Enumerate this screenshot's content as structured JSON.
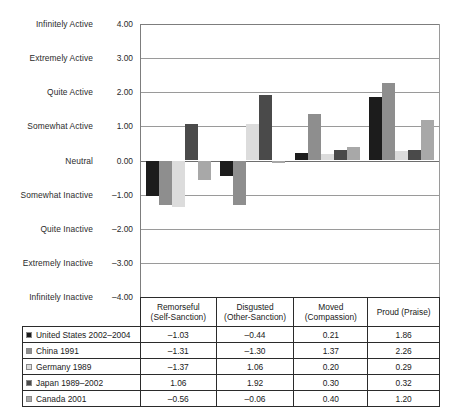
{
  "chart_data": {
    "type": "bar",
    "title": "",
    "xlabel": "",
    "ylabel": "",
    "ylim": [
      -4,
      4
    ],
    "grid": true,
    "legend_position": "table-left",
    "categories": [
      "Remorseful (Self-Sanction)",
      "Disgusted (Other-Sanction)",
      "Moved (Compassion)",
      "Proud (Praise)"
    ],
    "series": [
      {
        "name": "United States 2002–2004",
        "color": "#1c1c1c",
        "values": [
          -1.03,
          -0.44,
          0.21,
          1.86
        ]
      },
      {
        "name": "China 1991",
        "color": "#8e8e8e",
        "values": [
          -1.31,
          -1.3,
          1.37,
          2.26
        ]
      },
      {
        "name": "Germany 1989",
        "color": "#dcdcdc",
        "values": [
          -1.37,
          1.06,
          0.2,
          0.29
        ]
      },
      {
        "name": "Japan 1989–2002",
        "color": "#4a4a4a",
        "values": [
          1.06,
          1.92,
          0.3,
          0.32
        ]
      },
      {
        "name": "Canada 2001",
        "color": "#a8a8a8",
        "values": [
          -0.56,
          -0.06,
          0.4,
          1.2
        ]
      }
    ],
    "y_ticks": [
      {
        "value": "4.00",
        "label": "Infinitely Active"
      },
      {
        "value": "3.00",
        "label": "Extremely Active"
      },
      {
        "value": "2.00",
        "label": "Quite Active"
      },
      {
        "value": "1.00",
        "label": "Somewhat Active"
      },
      {
        "value": "0.00",
        "label": "Neutral"
      },
      {
        "value": "–1.00",
        "label": "Somewhat Inactive"
      },
      {
        "value": "–2.00",
        "label": "Quite Inactive"
      },
      {
        "value": "–3.00",
        "label": "Extremely Inactive"
      },
      {
        "value": "–4.00",
        "label": "Infinitely Inactive"
      }
    ]
  },
  "table": {
    "headers": [
      {
        "line1": "Remorseful",
        "line2": "(Self-Sanction)"
      },
      {
        "line1": "Disgusted",
        "line2": "(Other-Sanction)"
      },
      {
        "line1": "Moved",
        "line2": "(Compassion)"
      },
      {
        "line1": "Proud (Praise)",
        "line2": ""
      }
    ],
    "rows": [
      {
        "name": "United States 2002–2004",
        "color": "#1c1c1c",
        "cells": [
          "–1.03",
          "–0.44",
          "0.21",
          "1.86"
        ]
      },
      {
        "name": "China 1991",
        "color": "#8e8e8e",
        "cells": [
          "–1.31",
          "–1.30",
          "1.37",
          "2.26"
        ]
      },
      {
        "name": "Germany 1989",
        "color": "#dcdcdc",
        "cells": [
          "–1.37",
          "1.06",
          "0.20",
          "0.29"
        ]
      },
      {
        "name": "Japan 1989–2002",
        "color": "#4a4a4a",
        "cells": [
          "1.06",
          "1.92",
          "0.30",
          "0.32"
        ]
      },
      {
        "name": "Canada 2001",
        "color": "#a8a8a8",
        "cells": [
          "–0.56",
          "–0.06",
          "0.40",
          "1.20"
        ]
      }
    ]
  }
}
